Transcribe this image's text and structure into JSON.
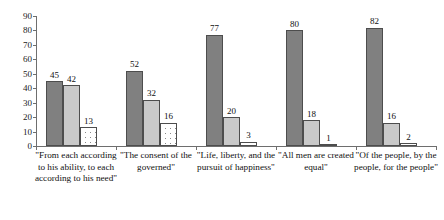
{
  "chart_data": {
    "type": "bar",
    "title": "",
    "xlabel": "",
    "ylabel": "",
    "ylim": [
      0,
      90
    ],
    "grid": false,
    "legend": "none",
    "orientation": "vertical",
    "grouping": "clustered",
    "yticks": [
      0,
      10,
      20,
      30,
      40,
      50,
      60,
      70,
      80,
      90
    ],
    "ytick_labels": [
      "0",
      "10",
      "20",
      "30",
      "40",
      "50",
      "60",
      "70",
      "80",
      "90"
    ],
    "categories": [
      "\"From each according to his ability, to each according to his need\"",
      "\"The consent of the governed\"",
      "\"Life, liberty, and the pursuit of happiness\"",
      "\"All men are created equal\"",
      "\"Of the people, by the people, for the people\""
    ],
    "series": [
      {
        "name": "series-1",
        "style": "dark-gray",
        "color": "#808080",
        "values": [
          45,
          52,
          77,
          80,
          82
        ]
      },
      {
        "name": "series-2",
        "style": "light-gray",
        "color": "#c9c9c9",
        "values": [
          42,
          32,
          20,
          18,
          16
        ]
      },
      {
        "name": "series-3",
        "style": "white-dotted",
        "color": "#ffffff",
        "values": [
          13,
          16,
          3,
          1,
          2
        ]
      }
    ],
    "data_labels": [
      [
        "45",
        "42",
        "13"
      ],
      [
        "52",
        "32",
        "16"
      ],
      [
        "77",
        "20",
        "3"
      ],
      [
        "80",
        "18",
        "1"
      ],
      [
        "82",
        "16",
        "2"
      ]
    ],
    "axis_color": "#6e6e6e",
    "bar_outline_color": "#4d4d4d"
  }
}
